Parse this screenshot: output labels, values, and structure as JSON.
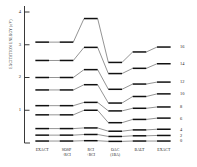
{
  "chart_data": {
    "type": "line",
    "title": "",
    "subtitle": "",
    "xlabel": "",
    "ylabel": "EXCITATION ENERGY (eV)",
    "ylim": [
      0,
      4.35
    ],
    "xlim": [
      0,
      6
    ],
    "grid": false,
    "legend_position": "right",
    "note": "Energy level correlation diagram: each series is drawn as horizontal level bars at each x category, joined by straight connector lines.",
    "categories": [
      "EXACT",
      "SOSP\n+RCI",
      "RCI\n+RCI",
      "OAC\n(1BA)",
      "BALT",
      "EXACT"
    ],
    "category_labels": [
      {
        "line1": "EXACT",
        "line2": ""
      },
      {
        "line1": "SOSP",
        "line2": "+RCI"
      },
      {
        "line1": "RCI",
        "line2": "+RCI"
      },
      {
        "line1": "OAC",
        "line2": "(1BA)"
      },
      {
        "line1": "BALT",
        "line2": ""
      },
      {
        "line1": "EXACT",
        "line2": ""
      }
    ],
    "ytick_values": [
      4,
      3,
      2,
      1
    ],
    "xtick_count": 6,
    "series": [
      {
        "name": "16",
        "values": [
          3.08,
          3.08,
          3.8,
          2.46,
          2.78,
          2.93
        ]
      },
      {
        "name": "14",
        "values": [
          2.52,
          2.52,
          2.92,
          2.12,
          2.28,
          2.42
        ]
      },
      {
        "name": "12",
        "values": [
          2.0,
          2.0,
          2.24,
          1.64,
          1.8,
          1.86
        ]
      },
      {
        "name": "10",
        "values": [
          1.62,
          1.62,
          1.78,
          1.22,
          1.42,
          1.5
        ]
      },
      {
        "name": "8",
        "values": [
          1.14,
          1.14,
          1.24,
          0.98,
          1.06,
          1.1
        ]
      },
      {
        "name": "6",
        "values": [
          0.86,
          0.86,
          1.0,
          0.62,
          0.72,
          0.76
        ]
      },
      {
        "name": "4",
        "values": [
          0.44,
          0.44,
          0.46,
          0.36,
          0.4,
          0.42
        ]
      },
      {
        "name": "2",
        "values": [
          0.24,
          0.24,
          0.26,
          0.2,
          0.22,
          0.23
        ]
      },
      {
        "name": "0",
        "values": [
          0.06,
          0.06,
          0.07,
          0.05,
          0.06,
          0.06
        ]
      }
    ]
  },
  "axes": {
    "y_axis_title": "EXCITATION ENERGY (eV)",
    "y_ticks": [
      "4",
      "3",
      "2",
      "1"
    ],
    "x_ticks": [
      "EXACT",
      "SOSP",
      "RCI",
      "OAC",
      "BALT",
      "EXACT"
    ],
    "x_ticks_second_line": [
      "",
      "+RCI",
      "+RCI",
      "(1BA)",
      "",
      ""
    ]
  },
  "right_labels": [
    "16",
    "14",
    "12",
    "10",
    "8",
    "6",
    "4",
    "2",
    "0"
  ],
  "colors": {
    "axis": "#222222",
    "level_bar": "#101010",
    "connector": "#3a3a3a",
    "background": "#ffffff"
  }
}
